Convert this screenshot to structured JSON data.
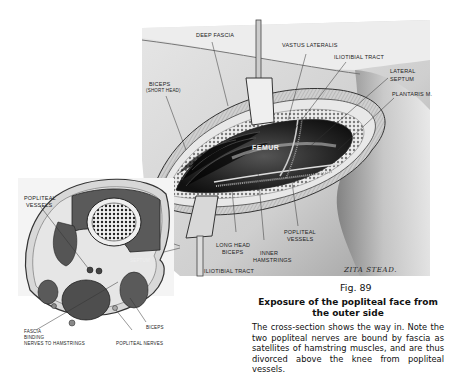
{
  "figure": {
    "main_view": {
      "labels": {
        "deep_fascia": "Deep fascia",
        "vastus_lateralis": "Vastus lateralis",
        "iliotibial_tract_top": "Iliotibial tract",
        "lateral_septum_1": "Lateral",
        "lateral_septum_2": "septum",
        "plantaris": "Plantaris m.",
        "biceps_1": "Biceps",
        "biceps_2": "(short head)",
        "femur": "FEMUR",
        "long_head_biceps_1": "Long head",
        "long_head_biceps_2": "biceps",
        "inner_hamstrings_1": "Inner",
        "inner_hamstrings_2": "hamstrings",
        "popliteal_vessels_1": "Popliteal",
        "popliteal_vessels_2": "vessels",
        "iliotibial_tract_bottom": "Iliotibial tract"
      },
      "signature": "ZITA STEAD."
    },
    "cross_section": {
      "labels": {
        "popliteal_vessels_1": "Popliteal",
        "popliteal_vessels_2": "vessels",
        "septum": "Septum",
        "fascia_1": "Fascia",
        "fascia_2": "binding",
        "fascia_3": "nerves to hamstrings",
        "biceps": "Biceps",
        "popliteal_nerves": "Popliteal nerves"
      }
    }
  },
  "caption": {
    "figure_number": "Fig. 89",
    "title": "Exposure of the popliteal face from the outer side",
    "body": "The cross-section shows the way in.  Note the two popliteal nerves are bound by fascia as satellites of hamstring muscles, and are thus divorced above the knee from popliteal vessels."
  }
}
